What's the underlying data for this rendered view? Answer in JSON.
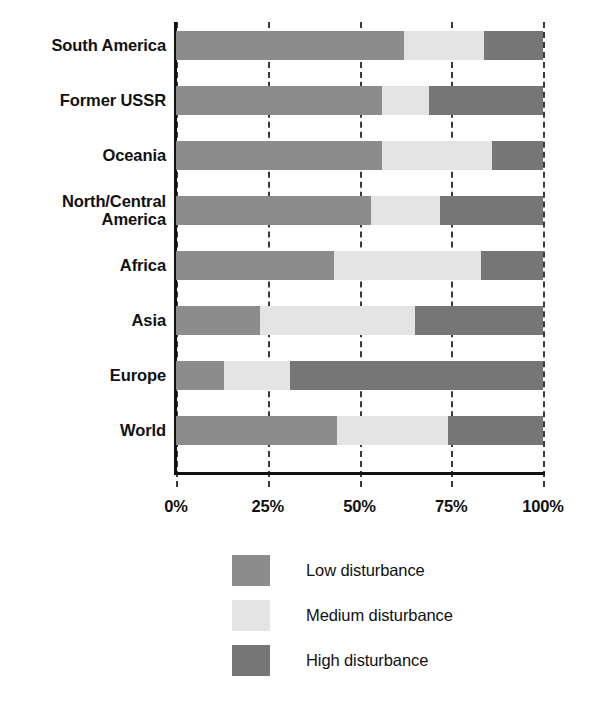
{
  "chart_data": {
    "type": "bar",
    "subtype": "stacked-horizontal-100pct",
    "title": "",
    "subtitle": "",
    "xlabel": "",
    "ylabel": "",
    "xlim": [
      0,
      100
    ],
    "xticks": [
      0,
      25,
      50,
      75,
      100
    ],
    "xtick_labels": [
      "0%",
      "25%",
      "50%",
      "75%",
      "100%"
    ],
    "grid": true,
    "grid_style": "dashed-vertical",
    "legend_position": "bottom-center",
    "orientation": "horizontal",
    "categories": [
      "South America",
      "Former USSR",
      "Oceania",
      "North/Central America",
      "Africa",
      "Asia",
      "Europe",
      "World"
    ],
    "series": [
      {
        "name": "Low disturbance",
        "color": "#8c8c8c",
        "values": [
          62,
          56,
          56,
          53,
          43,
          23,
          13,
          44
        ]
      },
      {
        "name": "Medium disturbance",
        "color": "#e4e4e4",
        "values": [
          22,
          13,
          30,
          19,
          40,
          42,
          18,
          30
        ]
      },
      {
        "name": "High disturbance",
        "color": "#767676",
        "values": [
          16,
          31,
          14,
          28,
          17,
          35,
          69,
          26
        ]
      }
    ]
  },
  "axis": {
    "y_categories": [
      {
        "label": "South America",
        "lines": [
          "South America"
        ]
      },
      {
        "label": "Former USSR",
        "lines": [
          "Former USSR"
        ]
      },
      {
        "label": "Oceania",
        "lines": [
          "Oceania"
        ]
      },
      {
        "label": "North/Central America",
        "lines": [
          "North/Central",
          "America"
        ]
      },
      {
        "label": "Africa",
        "lines": [
          "Africa"
        ]
      },
      {
        "label": "Asia",
        "lines": [
          "Asia"
        ]
      },
      {
        "label": "Europe",
        "lines": [
          "Europe"
        ]
      },
      {
        "label": "World",
        "lines": [
          "World"
        ]
      }
    ],
    "x_tick_labels": [
      "0%",
      "25%",
      "50%",
      "75%",
      "100%"
    ]
  },
  "legend": {
    "items": [
      {
        "label": "Low disturbance",
        "color": "#8c8c8c"
      },
      {
        "label": "Medium disturbance",
        "color": "#e4e4e4"
      },
      {
        "label": "High disturbance",
        "color": "#767676"
      }
    ]
  },
  "colors": {
    "low": "#8c8c8c",
    "medium": "#e4e4e4",
    "high": "#767676",
    "axis": "#111111",
    "grid": "#3a3a3a",
    "background": "#ffffff"
  }
}
